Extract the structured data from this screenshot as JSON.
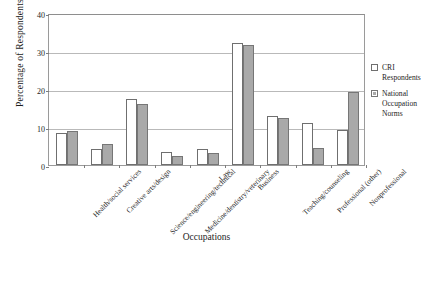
{
  "chart_data": {
    "type": "bar",
    "title": "",
    "xlabel": "Occupations",
    "ylabel": "Percentage of Respondents",
    "ylim": [
      0,
      40
    ],
    "yticks": [
      0,
      10,
      20,
      30,
      40
    ],
    "grid": true,
    "legend_position": "right",
    "categories": [
      "Health/social services",
      "Creative arts/design",
      "Science/engineering/technical",
      "Medicine/dentistry/veterinary",
      "Law",
      "Business",
      "Teaching/counseling",
      "Professional (other)",
      "Nonprofessional"
    ],
    "series": [
      {
        "name": "CRI Respondents",
        "color": "#ffffff",
        "values": [
          8.4,
          4.1,
          17.5,
          3.3,
          4.3,
          32.1,
          12.8,
          11.0,
          9.1
        ]
      },
      {
        "name": "National Occupation Norms",
        "color": "#a9a9a9",
        "values": [
          9.0,
          5.4,
          16.0,
          2.5,
          3.1,
          31.6,
          12.3,
          4.5,
          19.3
        ]
      }
    ]
  },
  "legend": {
    "items": [
      {
        "label": "CRI Respondents"
      },
      {
        "label": "National Occupation Norms"
      }
    ]
  }
}
